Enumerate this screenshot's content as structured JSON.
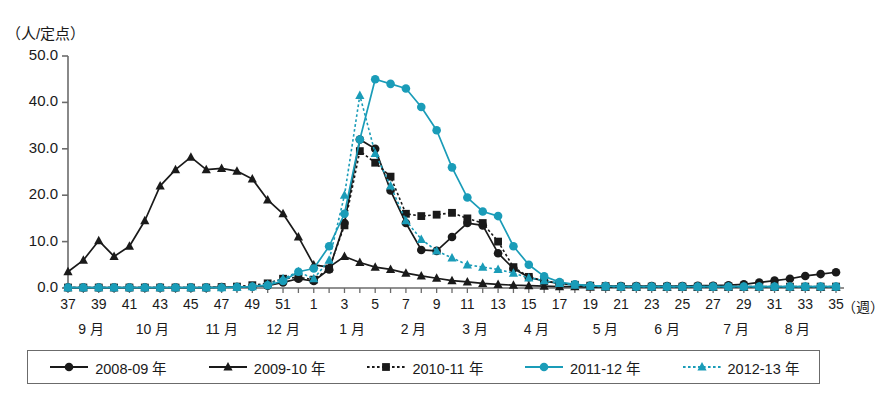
{
  "chart_data": {
    "type": "line",
    "title": "",
    "ylabel": "（人/定点）",
    "xlabel": "（週）",
    "ylim": [
      0,
      50
    ],
    "yticks": [
      "0.0",
      "10.0",
      "20.0",
      "30.0",
      "40.0",
      "50.0"
    ],
    "grid": false,
    "legend_position": "bottom",
    "x": [
      37,
      38,
      39,
      40,
      41,
      42,
      43,
      44,
      45,
      46,
      47,
      48,
      49,
      50,
      51,
      52,
      1,
      2,
      3,
      4,
      5,
      6,
      7,
      8,
      9,
      10,
      11,
      12,
      13,
      14,
      15,
      16,
      17,
      18,
      19,
      20,
      21,
      22,
      23,
      24,
      25,
      26,
      27,
      28,
      29,
      30,
      31,
      32,
      33,
      34,
      35
    ],
    "xtick_labels": [
      "37",
      "39",
      "41",
      "43",
      "45",
      "47",
      "49",
      "51",
      "1",
      "3",
      "5",
      "7",
      "9",
      "11",
      "13",
      "15",
      "17",
      "19",
      "21",
      "23",
      "25",
      "27",
      "29",
      "31",
      "33",
      "35"
    ],
    "month_labels": [
      "9 月",
      "10 月",
      "11 月",
      "12 月",
      "1 月",
      "2 月",
      "3 月",
      "4 月",
      "5 月",
      "6 月",
      "7 月",
      "8 月"
    ],
    "series": [
      {
        "name": "2008-09 年",
        "color": "#1a1a1a",
        "marker": "circle",
        "dash": "solid",
        "values": [
          0.1,
          0.1,
          0.1,
          0.1,
          0.1,
          0.1,
          0.1,
          0.1,
          0.1,
          0.1,
          0.2,
          0.2,
          0.3,
          0.5,
          1.2,
          2.0,
          1.5,
          4.0,
          14.0,
          32.0,
          30.0,
          21.0,
          14.0,
          8.2,
          8.0,
          11.0,
          14.0,
          13.5,
          7.5,
          4.2,
          2.3,
          1.5,
          1.0,
          0.7,
          0.5,
          0.4,
          0.4,
          0.4,
          0.4,
          0.4,
          0.4,
          0.5,
          0.5,
          0.6,
          0.8,
          1.2,
          1.6,
          2.0,
          2.6,
          3.0,
          3.4
        ]
      },
      {
        "name": "2009-10 年",
        "color": "#1a1a1a",
        "marker": "triangle",
        "dash": "solid",
        "values": [
          3.5,
          6.0,
          10.2,
          6.8,
          9.0,
          14.5,
          22.0,
          25.5,
          28.2,
          25.5,
          25.8,
          25.2,
          23.5,
          19.0,
          16.0,
          11.0,
          5.0,
          4.5,
          6.8,
          5.5,
          4.5,
          4.0,
          3.2,
          2.6,
          2.1,
          1.6,
          1.3,
          1.0,
          0.8,
          0.6,
          0.5,
          0.4,
          0.3,
          0.3,
          0.2,
          0.2,
          0.2,
          0.2,
          0.2,
          0.2,
          0.2,
          0.2,
          0.2,
          0.2,
          0.2,
          0.2,
          0.2,
          0.2,
          0.2,
          0.2,
          0.2
        ]
      },
      {
        "name": "2010-11 年",
        "color": "#1a1a1a",
        "marker": "square",
        "dash": "dotted",
        "values": [
          0.1,
          0.1,
          0.1,
          0.1,
          0.1,
          0.1,
          0.1,
          0.1,
          0.1,
          0.1,
          0.2,
          0.3,
          0.6,
          1.0,
          2.0,
          2.3,
          1.8,
          4.2,
          13.5,
          29.5,
          27.0,
          24.0,
          16.0,
          15.5,
          15.8,
          16.2,
          15.0,
          14.0,
          10.0,
          4.5,
          2.4,
          1.5,
          1.0,
          0.7,
          0.5,
          0.4,
          0.3,
          0.3,
          0.3,
          0.3,
          0.3,
          0.3,
          0.3,
          0.3,
          0.3,
          0.3,
          0.3,
          0.3,
          0.3,
          0.3,
          0.3
        ]
      },
      {
        "name": "2011-12 年",
        "color": "#1a9cb8",
        "marker": "circle",
        "dash": "solid",
        "values": [
          0.1,
          0.1,
          0.1,
          0.1,
          0.1,
          0.1,
          0.1,
          0.1,
          0.1,
          0.1,
          0.1,
          0.2,
          0.3,
          0.6,
          1.5,
          3.5,
          4.2,
          9.0,
          16.0,
          32.0,
          45.0,
          44.0,
          43.0,
          39.0,
          34.0,
          26.0,
          19.5,
          16.5,
          15.5,
          9.0,
          5.0,
          2.5,
          1.3,
          0.8,
          0.5,
          0.4,
          0.3,
          0.3,
          0.3,
          0.3,
          0.3,
          0.3,
          0.3,
          0.3,
          0.3,
          0.3,
          0.3,
          0.3,
          0.3,
          0.3,
          0.3
        ]
      },
      {
        "name": "2012-13 年",
        "color": "#1a9cb8",
        "marker": "triangle",
        "dash": "dotted",
        "values": [
          0.1,
          0.1,
          0.1,
          0.1,
          0.1,
          0.1,
          0.1,
          0.1,
          0.1,
          0.1,
          0.1,
          0.2,
          0.3,
          0.8,
          2.0,
          3.5,
          2.0,
          6.0,
          20.0,
          41.5,
          29.0,
          22.0,
          14.5,
          10.5,
          8.0,
          6.5,
          5.0,
          4.5,
          4.0,
          3.2,
          2.2,
          1.6,
          1.0,
          0.6,
          0.4,
          0.3,
          0.3,
          0.3,
          0.3,
          0.3,
          0.3,
          0.3,
          0.3,
          0.3,
          0.3,
          0.3,
          0.3,
          0.3,
          0.3,
          0.3,
          0.3
        ]
      }
    ]
  },
  "legend": {
    "items": [
      {
        "label": "2008-09 年"
      },
      {
        "label": "2009-10 年"
      },
      {
        "label": "2010-11 年"
      },
      {
        "label": "2011-12 年"
      },
      {
        "label": "2012-13 年"
      }
    ]
  },
  "colors": {
    "black": "#1a1a1a",
    "teal": "#1a9cb8",
    "axis": "#6b6b6b"
  }
}
